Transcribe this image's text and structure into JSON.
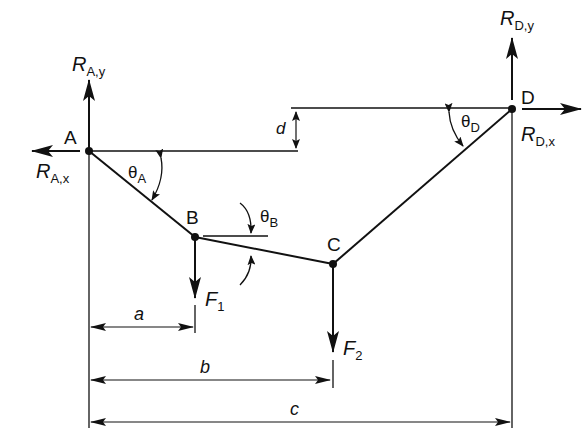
{
  "diagram": {
    "points": {
      "A": {
        "label": "A",
        "x": 89,
        "y": 151
      },
      "B": {
        "label": "B",
        "x": 195,
        "y": 237
      },
      "C": {
        "label": "C",
        "x": 333,
        "y": 264
      },
      "D": {
        "label": "D",
        "x": 512,
        "y": 109
      }
    },
    "reactions": {
      "RAy": {
        "main": "R",
        "sub": "A,y"
      },
      "RAx": {
        "main": "R",
        "sub": "A,x"
      },
      "RDy": {
        "main": "R",
        "sub": "D,y"
      },
      "RDx": {
        "main": "R",
        "sub": "D,x"
      }
    },
    "forces": {
      "F1": {
        "main": "F",
        "sub": "1"
      },
      "F2": {
        "main": "F",
        "sub": "2"
      }
    },
    "angles": {
      "thetaA": {
        "main": "θ",
        "sub": "A"
      },
      "thetaB": {
        "main": "θ",
        "sub": "B"
      },
      "thetaD": {
        "main": "θ",
        "sub": "D"
      }
    },
    "dimensions": {
      "a": "a",
      "b": "b",
      "c": "c",
      "d": "d"
    },
    "colors": {
      "ink": "#111111",
      "background": "#ffffff"
    }
  }
}
